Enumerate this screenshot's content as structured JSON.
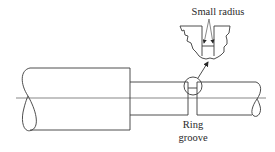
{
  "diagram": {
    "labels": {
      "small_radius": "Small radius",
      "ring_groove_line1": "Ring",
      "ring_groove_line2": "groove"
    },
    "components": [
      {
        "name": "large-diameter shaft section"
      },
      {
        "name": "reduced-diameter shaft section"
      },
      {
        "name": "ring groove"
      },
      {
        "name": "enlarged groove detail showing small radius corners"
      },
      {
        "name": "centerline"
      }
    ],
    "colors": {
      "line": "#3a3a3a",
      "background": "#ffffff"
    }
  }
}
